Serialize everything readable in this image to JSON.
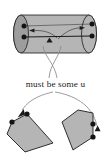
{
  "figure": {
    "kind": "mathematical-diagram",
    "caption": "must be some u",
    "colors": {
      "fill": "#b3b3b3",
      "fill_dark": "#9a9a9a",
      "stroke": "#1b1b1b",
      "marker": "#141414",
      "background": "#ffffff",
      "curve": "#6e6e6e"
    },
    "cylinder": {
      "name": "cylinder",
      "left_cap_center_x": 21,
      "left_cap_center_y": 34,
      "right_cap_center_x": 89,
      "right_cap_center_y": 34,
      "cap_rx": 7.5,
      "cap_ry": 19,
      "axis_label": "",
      "markers": [
        {
          "id": "p1",
          "x": 24,
          "y": 26
        },
        {
          "id": "p2",
          "x": 24,
          "y": 37
        },
        {
          "id": "p3",
          "x": 92,
          "y": 24
        },
        {
          "id": "p4",
          "x": 92,
          "y": 36
        }
      ],
      "arrowheads": [
        {
          "id": "left-inward-arrow",
          "x": 30,
          "y": 31,
          "direction": "left"
        },
        {
          "id": "right-inward-arrow",
          "x": 84,
          "y": 28,
          "direction": "right"
        },
        {
          "id": "center-up-arrow",
          "x": 50,
          "y": 41,
          "direction": "up"
        }
      ]
    },
    "polygons": [
      {
        "id": "left-polygon",
        "markers": [
          {
            "id": "lp1",
            "x": 12,
            "y": 122
          },
          {
            "id": "lp2",
            "x": 27,
            "y": 114
          }
        ],
        "arrowhead": {
          "id": "left-polygon-arrow",
          "x": 19,
          "y": 116,
          "direction": "down-left"
        }
      },
      {
        "id": "right-polygon",
        "markers": [
          {
            "id": "rp1",
            "x": 93,
            "y": 124
          },
          {
            "id": "rp2",
            "x": 93,
            "y": 137
          }
        ],
        "arrowhead": {
          "id": "right-polygon-arrow",
          "x": 97,
          "y": 130,
          "direction": "up"
        }
      }
    ],
    "connectors": [
      {
        "id": "connector-cross-left",
        "from": "cylinder-interior",
        "to": "caption-area"
      },
      {
        "id": "connector-cross-right",
        "from": "cylinder-interior",
        "to": "caption-area"
      },
      {
        "id": "connector-to-left-polygon",
        "from": "caption-area",
        "to": "left-polygon"
      },
      {
        "id": "connector-to-right-polygon",
        "from": "caption-area",
        "to": "right-polygon"
      }
    ]
  }
}
